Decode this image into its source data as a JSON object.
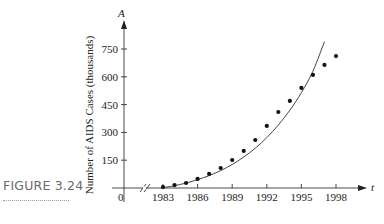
{
  "figure": {
    "label": "FIGURE 3.24"
  },
  "chart_data": {
    "type": "scatter",
    "title": "",
    "xlabel": "t",
    "ylabel": "Number of AIDS Cases (thousands)",
    "y_axis_var": "A",
    "x_ticks": [
      1983,
      1986,
      1989,
      1992,
      1995,
      1998
    ],
    "y_ticks": [
      150,
      300,
      450,
      600,
      750
    ],
    "origin_label": "0",
    "xlim": [
      1980,
      2000
    ],
    "ylim": [
      0,
      820
    ],
    "grid": false,
    "legend": null,
    "axis_break_on_x": true,
    "series": [
      {
        "name": "Observed cases",
        "kind": "points",
        "x": [
          1983,
          1984,
          1985,
          1986,
          1987,
          1988,
          1989,
          1990,
          1991,
          1992,
          1993,
          1994,
          1995,
          1996,
          1997,
          1998
        ],
        "values": [
          5,
          16,
          27,
          49,
          76,
          108,
          151,
          200,
          259,
          335,
          410,
          470,
          540,
          610,
          664,
          712
        ]
      },
      {
        "name": "Fitted model",
        "kind": "curve",
        "x": [
          1983,
          1984,
          1985,
          1986,
          1987,
          1988,
          1989,
          1990,
          1991,
          1992,
          1993,
          1994,
          1995,
          1996,
          1997
        ],
        "values": [
          2,
          12,
          27,
          45,
          67,
          94,
          127,
          167,
          215,
          272,
          340,
          420,
          515,
          630,
          790
        ]
      }
    ]
  }
}
